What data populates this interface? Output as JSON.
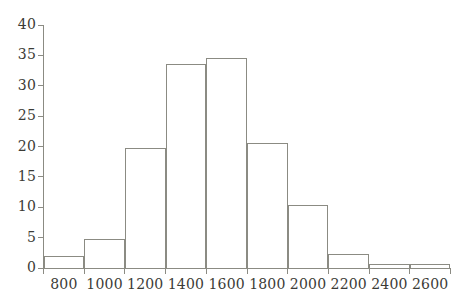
{
  "chart_data": {
    "type": "bar",
    "title": "",
    "subtitle": "",
    "xlabel": "",
    "ylabel": "",
    "grid": false,
    "legend": "none",
    "bin_width": 200,
    "bin_edges": [
      700,
      900,
      1100,
      1300,
      1500,
      1700,
      1900,
      2100,
      2300,
      2500,
      2700
    ],
    "categories": [
      "800",
      "1000",
      "1200",
      "1400",
      "1600",
      "1800",
      "2000",
      "2200",
      "2400",
      "2600"
    ],
    "values": [
      2.0,
      4.7,
      19.8,
      33.6,
      34.6,
      20.5,
      10.3,
      2.3,
      0.7,
      0.7
    ],
    "xlim": [
      700,
      2700
    ],
    "ylim": [
      0,
      40
    ],
    "x_ticks": [
      "800",
      "1000",
      "1200",
      "1400",
      "1600",
      "1800",
      "2000",
      "2200",
      "2400",
      "2600"
    ],
    "x_tick_values": [
      800,
      1000,
      1200,
      1400,
      1600,
      1800,
      2000,
      2200,
      2400,
      2600
    ],
    "y_ticks": [
      "0",
      "5",
      "10",
      "15",
      "20",
      "25",
      "30",
      "35",
      "40"
    ],
    "y_tick_values": [
      0,
      5,
      10,
      15,
      20,
      25,
      30,
      35,
      40
    ],
    "colors": {
      "background": "#ffffff",
      "axis": "#8b8b83",
      "bar_edge": "#8b8b83",
      "bar_fill": "transparent",
      "text": "#3b3b36"
    }
  }
}
